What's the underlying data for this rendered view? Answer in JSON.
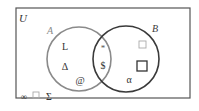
{
  "diagram": {
    "type": "venn",
    "universe": {
      "label": "U"
    },
    "sets": [
      {
        "name": "A",
        "label": "A",
        "color": "#8a8a8a"
      },
      {
        "name": "B",
        "label": "B",
        "color": "#3a3a3a"
      }
    ],
    "regions": {
      "only_A": [
        "L",
        "Δ",
        "@"
      ],
      "A_and_B": [
        "*",
        "$"
      ],
      "only_B": [
        "□",
        "□",
        "α"
      ],
      "outside": [
        "∞",
        "□",
        "Σ"
      ]
    },
    "elements": {
      "a1": "L",
      "a2": "Δ",
      "a3": "@",
      "ab1": "*",
      "ab2": "$",
      "b1": "□",
      "b2": "□",
      "b3": "α",
      "u1": "∞",
      "u2": "□",
      "u3": "Σ"
    }
  },
  "colors": {
    "border": "#555555",
    "circle_a": "#8a8a8a",
    "circle_b": "#3a3a3a",
    "text": "#333333",
    "light_square": "#aaaaaa"
  }
}
